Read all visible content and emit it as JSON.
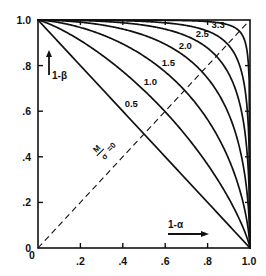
{
  "chart_data": {
    "type": "line",
    "title": "",
    "subtitle": "",
    "xlabel": "1-α",
    "ylabel": "1-β",
    "xlim": [
      0,
      1
    ],
    "ylim": [
      0,
      1
    ],
    "grid": false,
    "legend_position": "inline-curve-labels",
    "xticks": [
      0,
      0.2,
      0.4,
      0.6,
      0.8,
      1.0
    ],
    "xticklabels": [
      "0",
      ".2",
      ".4",
      ".6",
      ".8",
      "1.0"
    ],
    "yticks": [
      0,
      0.2,
      0.4,
      0.6,
      0.8,
      1.0
    ],
    "yticklabels": [
      "0",
      ".2",
      ".4",
      ".6",
      ".8",
      "1.0"
    ],
    "parameter_symbol_numerator": "M",
    "parameter_symbol_denominator": "σ",
    "baseline_label": "=0",
    "annotations": [
      {
        "text": "M/σ =0",
        "x": 0.33,
        "y": 0.52,
        "rotation": -45,
        "role": "baseline-parameter"
      }
    ],
    "reference_line": {
      "name": "chance-diagonal",
      "style": "dashed",
      "from": [
        0,
        0
      ],
      "to": [
        1,
        1
      ]
    },
    "series": [
      {
        "name": "0",
        "label": "M/σ =0",
        "label_x": 0.33,
        "label_y": 0.52,
        "x": [
          0.0,
          0.1,
          0.2,
          0.3,
          0.4,
          0.5,
          0.6,
          0.7,
          0.8,
          0.9,
          1.0
        ],
        "values": [
          1.0,
          0.9,
          0.8,
          0.7,
          0.6,
          0.5,
          0.4,
          0.3,
          0.2,
          0.1,
          0.0
        ]
      },
      {
        "name": "0.5",
        "label": "0.5",
        "label_x": 0.44,
        "label_y": 0.62,
        "x": [
          0.0,
          0.1,
          0.2,
          0.3,
          0.4,
          0.5,
          0.6,
          0.7,
          0.8,
          0.9,
          1.0
        ],
        "values": [
          1.0,
          0.938,
          0.877,
          0.813,
          0.745,
          0.673,
          0.594,
          0.507,
          0.404,
          0.274,
          0.0
        ]
      },
      {
        "name": "1.0",
        "label": "1.0",
        "label_x": 0.53,
        "label_y": 0.715,
        "x": [
          0.0,
          0.1,
          0.2,
          0.3,
          0.4,
          0.5,
          0.6,
          0.7,
          0.8,
          0.9,
          1.0
        ],
        "values": [
          1.0,
          0.972,
          0.938,
          0.899,
          0.855,
          0.803,
          0.741,
          0.663,
          0.56,
          0.405,
          0.0
        ]
      },
      {
        "name": "1.5",
        "label": "1.5",
        "label_x": 0.615,
        "label_y": 0.8,
        "x": [
          0.0,
          0.1,
          0.2,
          0.3,
          0.4,
          0.5,
          0.6,
          0.7,
          0.8,
          0.9,
          1.0
        ],
        "values": [
          1.0,
          0.989,
          0.974,
          0.954,
          0.928,
          0.894,
          0.847,
          0.782,
          0.686,
          0.524,
          0.0
        ]
      },
      {
        "name": "2.0",
        "label": "2.0",
        "label_x": 0.695,
        "label_y": 0.875,
        "x": [
          0.0,
          0.1,
          0.2,
          0.3,
          0.4,
          0.5,
          0.6,
          0.7,
          0.8,
          0.9,
          1.0
        ],
        "values": [
          1.0,
          0.996,
          0.991,
          0.982,
          0.969,
          0.95,
          0.921,
          0.874,
          0.794,
          0.636,
          0.0
        ]
      },
      {
        "name": "2.5",
        "label": "2.5",
        "label_x": 0.775,
        "label_y": 0.925,
        "x": [
          0.0,
          0.1,
          0.2,
          0.3,
          0.4,
          0.5,
          0.6,
          0.7,
          0.8,
          0.9,
          1.0
        ],
        "values": [
          1.0,
          0.999,
          0.997,
          0.994,
          0.989,
          0.98,
          0.964,
          0.935,
          0.875,
          0.736,
          0.0
        ]
      },
      {
        "name": "3.3",
        "label": "3.3",
        "label_x": 0.85,
        "label_y": 0.965,
        "x": [
          0.0,
          0.1,
          0.2,
          0.3,
          0.4,
          0.5,
          0.6,
          0.7,
          0.8,
          0.9,
          1.0
        ],
        "values": [
          1.0,
          1.0,
          0.9997,
          0.9992,
          0.9981,
          0.9957,
          0.9905,
          0.9785,
          0.9491,
          0.8604,
          0.0
        ]
      }
    ]
  },
  "axes": {
    "x_axis_label": "1-α",
    "y_axis_label": "1-β",
    "x_tick_labels": [
      "0",
      ".2",
      ".4",
      ".6",
      ".8",
      "1.0"
    ],
    "y_tick_labels": [
      "1.0",
      ".8",
      ".6",
      ".4",
      ".2",
      "0"
    ]
  },
  "style": {
    "line_color": "#111111",
    "frame_color": "#111111",
    "text_color": "#111111",
    "background": "#ffffff"
  }
}
